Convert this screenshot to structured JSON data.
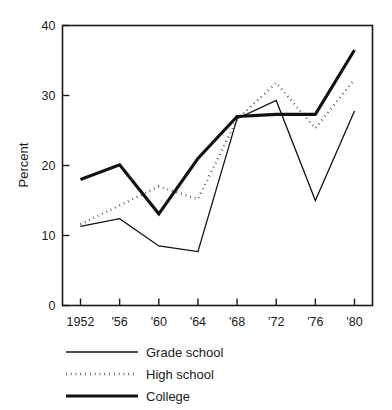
{
  "chart_data": {
    "type": "line",
    "title": "",
    "subtitle": "",
    "xlabel": "",
    "ylabel": "Percent",
    "x": [
      1952,
      1956,
      1960,
      1964,
      1968,
      1972,
      1976,
      1980
    ],
    "categories": [
      "1952",
      "'56",
      "'60",
      "'64",
      "'68",
      "'72",
      "'76",
      "'80"
    ],
    "xtick_labels": [
      "1952",
      "'56",
      "'60",
      "'64",
      "'68",
      "'72",
      "'76",
      "'80"
    ],
    "ytick_labels": [
      "0",
      "10",
      "20",
      "30",
      "40"
    ],
    "yticks": [
      0,
      10,
      20,
      30,
      40
    ],
    "ylim": [
      0,
      40
    ],
    "xlim": [
      1950.5,
      1981.5
    ],
    "grid": false,
    "legend_position": "below",
    "series": [
      {
        "name": "Grade school",
        "style": "thin-solid",
        "values": [
          11.3,
          12.4,
          8.5,
          7.7,
          26.7,
          29.3,
          15.0,
          27.8
        ]
      },
      {
        "name": "High school",
        "style": "dotted",
        "values": [
          11.6,
          14.3,
          17.0,
          15.2,
          26.6,
          31.8,
          25.3,
          32.3
        ]
      },
      {
        "name": "College",
        "style": "thick-solid",
        "values": [
          18.0,
          20.1,
          13.1,
          21.0,
          27.0,
          27.3,
          27.3,
          36.5
        ]
      }
    ]
  },
  "legend": {
    "items": [
      {
        "label": "Grade school",
        "style": "thin-solid"
      },
      {
        "label": "High school",
        "style": "dotted"
      },
      {
        "label": "College",
        "style": "thick-solid"
      }
    ]
  },
  "axes": {
    "y_axis_title": "Percent"
  },
  "colors": {
    "ink": "#111111",
    "background": "#ffffff"
  }
}
